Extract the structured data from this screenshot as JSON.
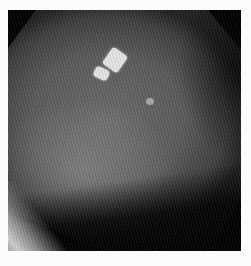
{
  "image": {
    "description": "Grayscale radiographic/fluoroscopic view with two bright rectangular markers and a small round bright dot",
    "alt": "Grayscale fluoroscopy image",
    "colors": {
      "background": "#fbfbfb",
      "frame": "#000000",
      "field_mid": "#5a5a5a",
      "marker": "#e4e4e4",
      "dot": "#a8a8a8"
    }
  }
}
